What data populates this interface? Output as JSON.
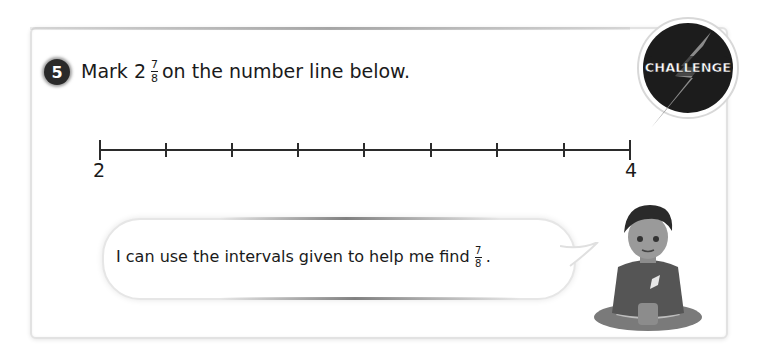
{
  "question": {
    "number": "5",
    "prefix": "Mark 2",
    "fraction": {
      "numerator": "7",
      "denominator": "8"
    },
    "suffix": "on the number line below."
  },
  "badge": {
    "label": "CHALLENGE",
    "colors": {
      "circle": "#1c1c1c",
      "bolt": "#8a8a8a",
      "text": "#ffffff"
    }
  },
  "number_line": {
    "start_label": "2",
    "end_label": "4",
    "intervals": 8
  },
  "speech_bubble": {
    "text": "I can use the intervals given to help me find",
    "fraction": {
      "numerator": "7",
      "denominator": "8"
    },
    "end": "."
  },
  "character": {
    "name": "child-sitting-cross-legged"
  }
}
